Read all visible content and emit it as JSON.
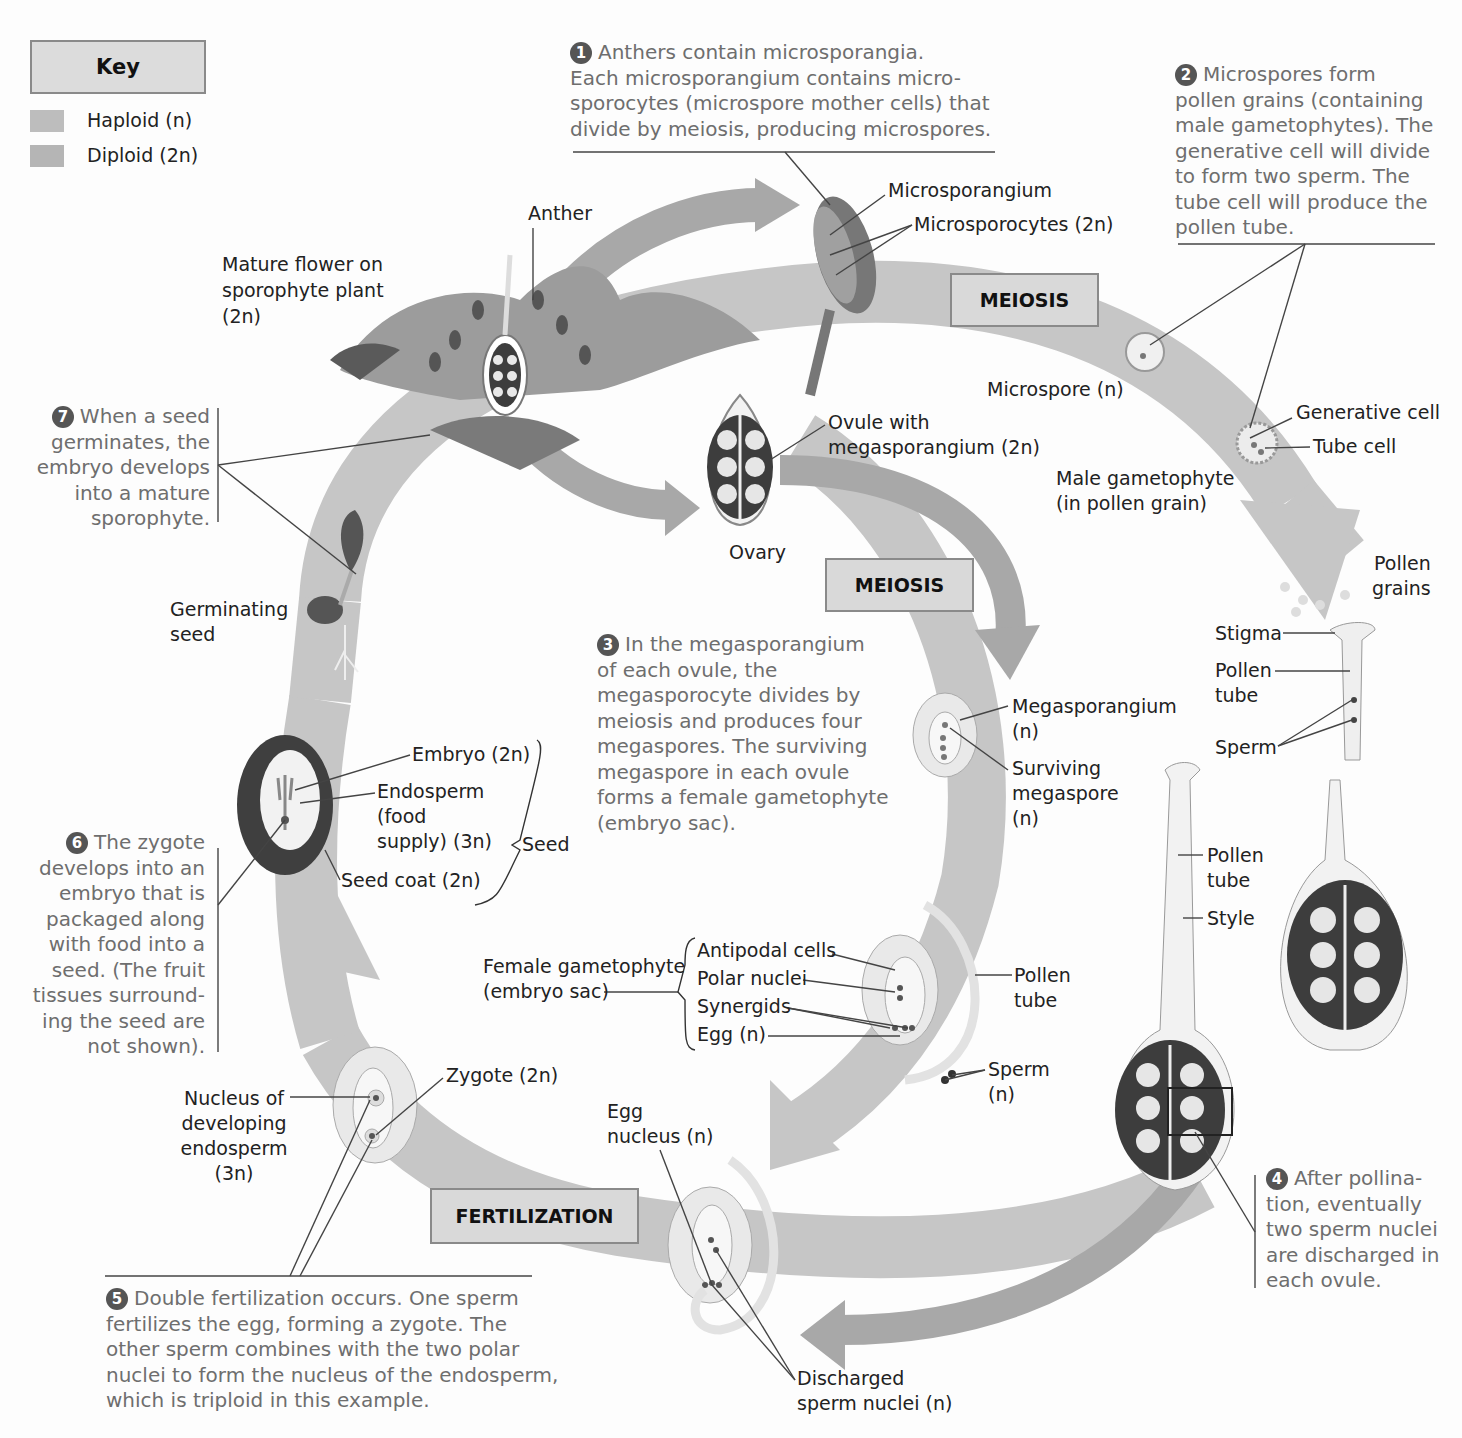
{
  "key": {
    "title": "Key",
    "items": [
      {
        "label": "Haploid (n)",
        "color": "#bfbfbf"
      },
      {
        "label": "Diploid (2n)",
        "color": "#b8b8b8"
      }
    ]
  },
  "process_boxes": {
    "meiosis_male": "MEIOSIS",
    "meiosis_female": "MEIOSIS",
    "fertilization": "FERTILIZATION"
  },
  "steps": [
    {
      "num": "1",
      "lines": [
        "Anthers contain microsporangia.",
        "Each microsporangium contains micro-",
        "sporocytes (microspore mother cells) that",
        "divide by meiosis, producing microspores."
      ]
    },
    {
      "num": "2",
      "lines": [
        "Microspores form",
        "pollen grains (containing",
        "male gametophytes). The",
        "generative cell will divide",
        "to form two sperm. The",
        "tube cell will produce the",
        "pollen tube."
      ]
    },
    {
      "num": "3",
      "lines": [
        "In the megasporangium",
        "of each ovule, the",
        "megasporocyte divides by",
        "meiosis and produces four",
        "megaspores. The surviving",
        "megaspore in each ovule",
        "forms a female gametophyte",
        "(embryo sac)."
      ]
    },
    {
      "num": "4",
      "lines": [
        "After pollina-",
        "tion, eventually",
        "two sperm nuclei",
        "are discharged in",
        "each ovule."
      ]
    },
    {
      "num": "5",
      "lines": [
        "Double fertilization occurs. One sperm",
        "fertilizes the egg, forming a zygote. The",
        "other sperm combines with the two polar",
        "nuclei to form the nucleus of the endosperm,",
        "which is triploid in this example."
      ]
    },
    {
      "num": "6",
      "lines": [
        "The zygote",
        "develops into an",
        "embryo that is",
        "packaged along",
        "with food into a",
        "seed. (The fruit",
        "tissues surround-",
        "ing the seed are",
        "not shown)."
      ]
    },
    {
      "num": "7",
      "lines": [
        "When a seed",
        "germinates, the",
        "embryo develops",
        "into a mature",
        "sporophyte."
      ]
    }
  ],
  "labels": {
    "mature_flower": [
      "Mature flower on",
      "sporophyte plant",
      "(2n)"
    ],
    "anther": "Anther",
    "microsporangium": "Microsporangium",
    "microsporocytes": "Microsporocytes (2n)",
    "microspore": "Microspore (n)",
    "generative_cell": "Generative cell",
    "tube_cell": "Tube cell",
    "male_gametophyte": [
      "Male gametophyte",
      "(in pollen grain)"
    ],
    "ovule_with_megasporangium": [
      "Ovule with",
      "megasporangium (2n)"
    ],
    "ovary": "Ovary",
    "pollen_grains": [
      "Pollen",
      "grains"
    ],
    "stigma": "Stigma",
    "pollen_tube_top": [
      "Pollen",
      "tube"
    ],
    "sperm_top": "Sperm",
    "megasporangium": [
      "Megasporangium",
      "(n)"
    ],
    "surviving_megaspore": [
      "Surviving",
      "megaspore",
      "(n)"
    ],
    "pollen_tube_style": [
      "Pollen",
      "tube"
    ],
    "style": "Style",
    "germinating_seed": [
      "Germinating",
      "seed"
    ],
    "embryo": "Embryo (2n)",
    "endosperm": [
      "Endosperm",
      "(food",
      "supply) (3n)"
    ],
    "seed_coat": "Seed coat (2n)",
    "seed": "Seed",
    "female_gametophyte": [
      "Female gametophyte",
      "(embryo sac)"
    ],
    "antipodal_cells": "Antipodal cells",
    "polar_nuclei": "Polar nuclei",
    "synergids": "Synergids",
    "egg": "Egg (n)",
    "pollen_tube_mid": [
      "Pollen",
      "tube"
    ],
    "sperm_mid": [
      "Sperm",
      "(n)"
    ],
    "nucleus_endosperm": [
      "Nucleus of",
      "developing",
      "endosperm",
      "(3n)"
    ],
    "zygote": "Zygote (2n)",
    "egg_nucleus": [
      "Egg",
      "nucleus (n)"
    ],
    "discharged_sperm": [
      "Discharged",
      "sperm nuclei (n)"
    ]
  },
  "colors": {
    "ribbon": "#c4c4c4",
    "arrow": "#a9a9a9",
    "box_fill": "#d9d9d9",
    "step_text": "#6e6e6e",
    "ovary_dark": "#3d3d3d"
  }
}
